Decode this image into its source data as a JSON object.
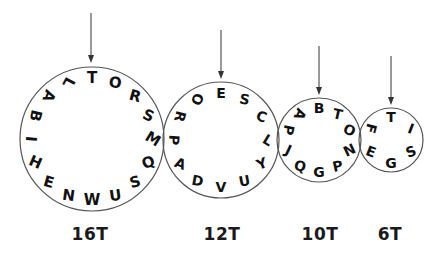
{
  "diagram": {
    "type": "letter-wheels",
    "stroke_color": "#555555",
    "letter_color": "#111111",
    "wheels": [
      {
        "label": "16T",
        "cx": 92,
        "cy": 139,
        "r": 72,
        "letter_r": 61,
        "font_size": 15,
        "arrow": {
          "x": 91,
          "y1": 13,
          "y2": 63
        },
        "label_x": 90,
        "label_y": 224,
        "letters": [
          "T",
          "O",
          "R",
          "S",
          "M",
          "Q",
          "S",
          "U",
          "W",
          "N",
          "E",
          "H",
          "I",
          "B",
          "A",
          "L"
        ]
      },
      {
        "label": "12T",
        "cx": 221,
        "cy": 140,
        "r": 58,
        "letter_r": 47,
        "font_size": 14,
        "arrow": {
          "x": 221,
          "y1": 30,
          "y2": 79
        },
        "label_x": 222,
        "label_y": 224,
        "letters": [
          "E",
          "S",
          "C",
          "L",
          "Y",
          "U",
          "V",
          "D",
          "A",
          "P",
          "R",
          "O"
        ]
      },
      {
        "label": "10T",
        "cx": 319,
        "cy": 140,
        "r": 42,
        "letter_r": 32,
        "font_size": 14,
        "arrow": {
          "x": 319,
          "y1": 46,
          "y2": 95
        },
        "label_x": 320,
        "label_y": 224,
        "letters": [
          "B",
          "T",
          "O",
          "N",
          "P",
          "G",
          "Q",
          "J",
          "P",
          "A"
        ]
      },
      {
        "label": "6T",
        "cx": 391,
        "cy": 140,
        "r": 32,
        "letter_r": 23,
        "font_size": 14,
        "arrow": {
          "x": 391,
          "y1": 56,
          "y2": 105
        },
        "label_x": 390,
        "label_y": 224,
        "letters": [
          "T",
          "I",
          "S",
          "G",
          "E",
          "F"
        ]
      }
    ]
  }
}
